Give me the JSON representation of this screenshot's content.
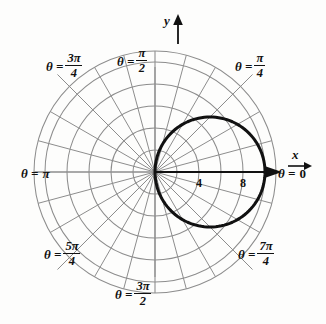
{
  "figure": {
    "kind": "polar-coordinate-grid-with-curve",
    "background_color": "#fdfdfc",
    "grid_color": "#8d8d8d",
    "curve_color": "#111111",
    "axis_color": "#111111"
  },
  "axes": {
    "x_label": "x",
    "y_label": "y"
  },
  "theta_labels": {
    "zero": {
      "lhs": "θ =",
      "value": "0"
    },
    "pi_over_2": {
      "lhs": "θ =",
      "num": "π",
      "den": "2"
    },
    "pi": {
      "lhs": "θ =",
      "value": "π"
    },
    "three_pi_over_4": {
      "lhs": "θ =",
      "num": "3π",
      "den": "4"
    },
    "pi_over_4": {
      "lhs": "θ =",
      "num": "π",
      "den": "4"
    },
    "five_pi_over_4": {
      "lhs": "θ =",
      "num": "5π",
      "den": "4"
    },
    "seven_pi_over_4": {
      "lhs": "θ =",
      "num": "7π",
      "den": "4"
    },
    "three_pi_over_2": {
      "lhs": "θ =",
      "num": "3π",
      "den": "2"
    }
  },
  "radial_ticks": [
    {
      "label": "4",
      "r": 4
    },
    {
      "label": "8",
      "r": 8
    }
  ],
  "chart_data": {
    "type": "line",
    "coordinate_system": "polar",
    "title": "",
    "xlabel": "x",
    "ylabel": "y",
    "grid": true,
    "legend": null,
    "origin_px": [
      155,
      172
    ],
    "pixels_per_unit": 11.0,
    "grid_rings_r": [
      2,
      4,
      6,
      8,
      10,
      11
    ],
    "grid_spokes_deg": [
      0,
      15,
      30,
      45,
      60,
      75,
      90,
      105,
      120,
      135,
      150,
      165,
      180,
      195,
      210,
      225,
      240,
      255,
      270,
      285,
      300,
      315,
      330,
      345
    ],
    "angle_tick_labels": [
      {
        "deg": 0,
        "text": "θ = 0"
      },
      {
        "deg": 45,
        "text": "θ = π/4"
      },
      {
        "deg": 90,
        "text": "θ = π/2"
      },
      {
        "deg": 135,
        "text": "θ = 3π/4"
      },
      {
        "deg": 180,
        "text": "θ = π"
      },
      {
        "deg": 225,
        "text": "θ = 5π/4"
      },
      {
        "deg": 270,
        "text": "θ = 3π/2"
      },
      {
        "deg": 315,
        "text": "θ = 7π/4"
      }
    ],
    "radial_tick_labels": [
      "4",
      "8"
    ],
    "axis_ranges": {
      "r": [
        0,
        11
      ]
    },
    "series": [
      {
        "name": "r = 10 cos θ",
        "equation_form": "r = a*cos(theta)",
        "a": 10,
        "style": "thick-solid",
        "color": "#111111",
        "description": "circle of diameter 10 centered at (5, 0), passing through the pole",
        "polar_points": [
          {
            "theta_deg": -90,
            "r": 0
          },
          {
            "theta_deg": -75,
            "r": 2.59
          },
          {
            "theta_deg": -60,
            "r": 5.0
          },
          {
            "theta_deg": -45,
            "r": 7.07
          },
          {
            "theta_deg": -30,
            "r": 8.66
          },
          {
            "theta_deg": -15,
            "r": 9.66
          },
          {
            "theta_deg": 0,
            "r": 10.0
          },
          {
            "theta_deg": 15,
            "r": 9.66
          },
          {
            "theta_deg": 30,
            "r": 8.66
          },
          {
            "theta_deg": 45,
            "r": 7.07
          },
          {
            "theta_deg": 60,
            "r": 5.0
          },
          {
            "theta_deg": 75,
            "r": 2.59
          },
          {
            "theta_deg": 90,
            "r": 0
          }
        ]
      }
    ]
  }
}
